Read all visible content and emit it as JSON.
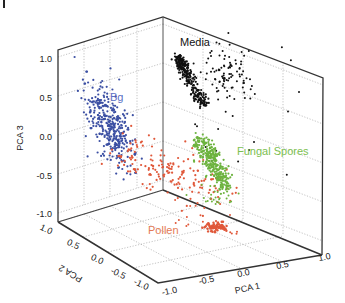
{
  "panel_label": "",
  "chart_data": {
    "type": "scatter",
    "title": "",
    "dimensions": 3,
    "xlabel": "PCA 1",
    "ylabel": "PCA 2",
    "zlabel": "PCA 3",
    "xlim": [
      -1.0,
      1.0
    ],
    "ylim": [
      -1.0,
      1.0
    ],
    "zlim": [
      -1.0,
      1.0
    ],
    "x_ticks": [
      "-1.0",
      "-0.5",
      "0.0",
      "0.5",
      "1.0"
    ],
    "y_ticks": [
      "1.0",
      "0.5",
      "0.0",
      "-0.5",
      "-1.0"
    ],
    "z_ticks": [
      "1.0",
      "0.5",
      "0.0",
      "-0.5",
      "-1.0"
    ],
    "grid": true,
    "legend_position": "inline annotations",
    "series": [
      {
        "name": "Bg",
        "color": "#3b4fa3",
        "label_color": "#5a6fc4",
        "approx_center_screen": [
          130,
          122
        ],
        "point_count_est": 350
      },
      {
        "name": "Media",
        "color": "#111111",
        "label_color": "#111111",
        "approx_center_screen": [
          190,
          90
        ],
        "point_count_est": 300
      },
      {
        "name": "Fungal Spores",
        "color": "#6db33f",
        "label_color": "#7cc04f",
        "approx_center_screen": [
          215,
          160
        ],
        "point_count_est": 300
      },
      {
        "name": "Pollen",
        "color": "#e0583a",
        "label_color": "#e47a55",
        "approx_center_screen": [
          160,
          170
        ],
        "point_count_est": 200
      }
    ]
  },
  "labels": {
    "bg": "Bg",
    "media": "Media",
    "fungal": "Fungal Spores",
    "pollen": "Pollen",
    "x_axis": "PCA 1",
    "y_axis": "PCA 2",
    "z_axis": "PCA 3",
    "z_ticks": [
      "1.0",
      "0.5",
      "0.0",
      "-0.5",
      "-1.0"
    ],
    "y_ticks": [
      "1.0",
      "0.5",
      "0.0",
      "-0.5",
      "-1.0"
    ],
    "x_ticks": [
      "-1.0",
      "-0.5",
      "0.0",
      "0.5",
      "1.0"
    ]
  }
}
